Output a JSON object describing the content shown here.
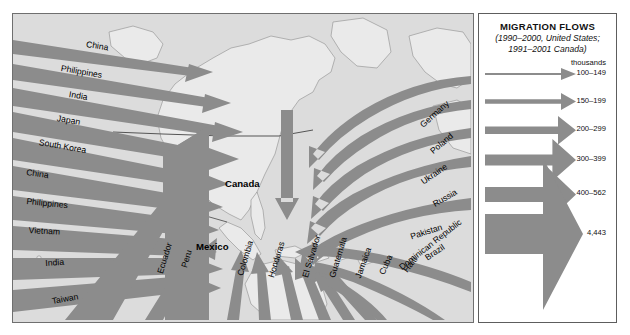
{
  "legend": {
    "title": "MIGRATION FLOWS",
    "subtitle_line1": "(1990–2000, United States;",
    "subtitle_line2": "1991–2001 Canada)",
    "units": "thousands",
    "entries": [
      {
        "label": "100–149",
        "width": 2.0
      },
      {
        "label": "150–199",
        "width": 4.5
      },
      {
        "label": "200–299",
        "width": 7.5
      },
      {
        "label": "300–399",
        "width": 11.0
      },
      {
        "label": "400–562",
        "width": 15.0
      },
      {
        "label": "4,443",
        "width": 40.0
      }
    ],
    "arrow_color": "#8c8c8c"
  },
  "map": {
    "ocean_color": "#dcdcdc",
    "land_color": "#e9e9e9",
    "flow_color": "#8c8c8c",
    "destination_labels": [
      {
        "name": "Canada",
        "text": "Canada"
      },
      {
        "name": "Mexico",
        "text": "Mexico"
      }
    ],
    "origins_west": [
      "China",
      "Philippines",
      "India",
      "Japan",
      "South Korea",
      "China",
      "Philippines",
      "Vietnam",
      "India",
      "Taiwan"
    ],
    "origins_east": [
      "Germany",
      "Poland",
      "Ukraine",
      "Russia",
      "Pakistan"
    ],
    "origins_south": [
      "Ecuador",
      "Peru",
      "Colombia",
      "Honduras",
      "El Salvador",
      "Guatemala",
      "Jamaica",
      "Cuba",
      "Haiti",
      "Dominican Republic",
      "Brazil"
    ]
  }
}
